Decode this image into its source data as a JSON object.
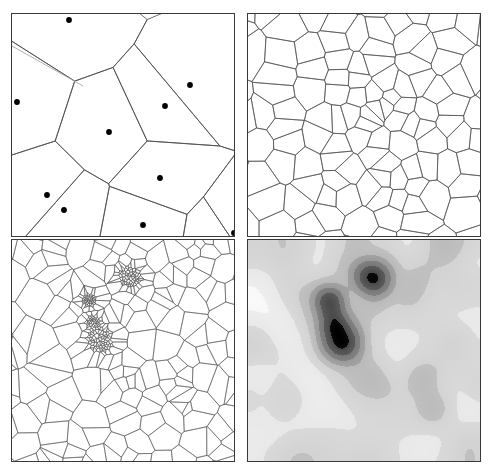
{
  "figure": {
    "type": "multi-panel-diagram",
    "title": "",
    "layout": "2x2 grid",
    "panel_count": 4,
    "background_color": "#ffffff",
    "border_color": "#3a3a3a",
    "line_color": "#4a4a4a",
    "light_line_color": "#a8a8a8",
    "point_color": "#000000",
    "canvas": {
      "width": 492,
      "height": 475
    }
  },
  "panels": [
    {
      "id": "panel-top-left",
      "name": "coarse-voronoi-with-seed-points",
      "position": "top-left",
      "bounds": {
        "x": 11,
        "y": 13,
        "w": 224,
        "h": 224
      },
      "description": "Coarse Voronoi tessellation with visible black seed points",
      "cell_count": 11,
      "point_count": 11,
      "points": [
        [
          68,
          19
        ],
        [
          16,
          101
        ],
        [
          189,
          84
        ],
        [
          164,
          105
        ],
        [
          108,
          131
        ],
        [
          159,
          177
        ],
        [
          46,
          194
        ],
        [
          63,
          209
        ],
        [
          142,
          224
        ],
        [
          224,
          238
        ],
        [
          233,
          232
        ]
      ]
    },
    {
      "id": "panel-top-right",
      "name": "refined-voronoi-level-1",
      "position": "top-right",
      "bounds": {
        "x": 247,
        "y": 13,
        "w": 234,
        "h": 224
      },
      "description": "Once-refined Voronoi mesh, cells graded smaller toward the interior",
      "cell_count": 120,
      "point_count": 120
    },
    {
      "id": "panel-bottom-left",
      "name": "refined-voronoi-level-2-clustered",
      "position": "bottom-left",
      "bounds": {
        "x": 11,
        "y": 239,
        "w": 224,
        "h": 223
      },
      "description": "Highly refined Voronoi mesh with four dense seed clusters near the center-left",
      "cell_count": 430,
      "point_count": 430,
      "cluster_count": 4,
      "clusters": [
        {
          "cx": 130,
          "cy": 276,
          "r": 12
        },
        {
          "cx": 89,
          "cy": 300,
          "r": 8
        },
        {
          "cx": 93,
          "cy": 322,
          "r": 8
        },
        {
          "cx": 100,
          "cy": 340,
          "r": 14
        }
      ]
    },
    {
      "id": "panel-bottom-right",
      "name": "grayscale-density-field",
      "position": "bottom-right",
      "bounds": {
        "x": 247,
        "y": 239,
        "w": 234,
        "h": 223
      },
      "description": "Grayscale density / elevation field with banded contours; black blobs mark the four high-density cluster cores",
      "colormap": "grayscale",
      "levels": [
        "#000000",
        "#555555",
        "#7d7d7d",
        "#9e9e9e",
        "#bdbdbd",
        "#d6d6d6",
        "#ebebeb",
        "#fafafa"
      ],
      "blob_count": 4
    }
  ]
}
